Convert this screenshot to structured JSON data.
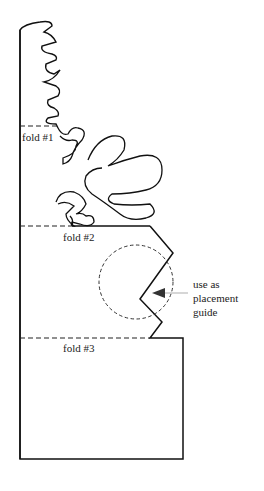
{
  "diagram": {
    "fold_labels": [
      "fold #1",
      "fold #2",
      "fold #3"
    ],
    "guide_text": [
      "use as",
      "placement",
      "guide"
    ],
    "colors": {
      "outline": "#111111",
      "dashes": "#222222",
      "arrow_line": "#bbbbbb",
      "arrow_head": "#333333"
    }
  }
}
